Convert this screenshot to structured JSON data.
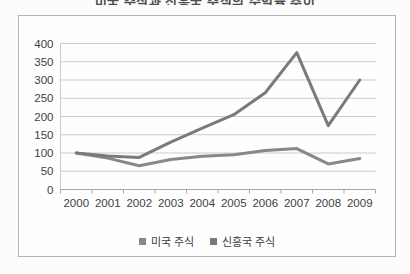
{
  "page": {
    "cropped_title_fragment": "미국 주식과 신흥국 주식의 수익률 추이"
  },
  "chart_data": {
    "type": "line",
    "categories": [
      "2000",
      "2001",
      "2002",
      "2003",
      "2004",
      "2005",
      "2006",
      "2007",
      "2008",
      "2009"
    ],
    "series": [
      {
        "name": "미국 주식",
        "color": "#888888",
        "values": [
          100,
          86,
          65,
          82,
          91,
          95,
          107,
          112,
          70,
          85
        ]
      },
      {
        "name": "신흥국 주식",
        "color": "#7a7a7a",
        "values": [
          100,
          92,
          88,
          130,
          168,
          205,
          265,
          375,
          175,
          300
        ]
      }
    ],
    "ylim": [
      0,
      400
    ],
    "yticks": [
      0,
      50,
      100,
      150,
      200,
      250,
      300,
      350,
      400
    ],
    "grid": "horizontal",
    "legend_position": "bottom",
    "colors": {
      "grid": "#cbcbcb",
      "axis": "#a6a6a6",
      "label": "#3f3f3f",
      "frame": "#b5b5b5"
    }
  }
}
